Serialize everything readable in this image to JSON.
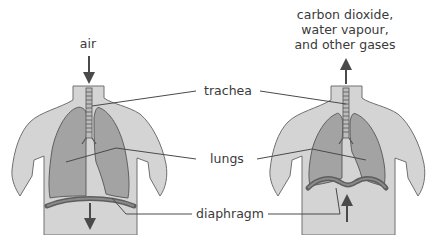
{
  "panels": {
    "left": {
      "state": "inhale",
      "label": "air",
      "arrow_direction_top": "down",
      "arrow_direction_bottom": "down"
    },
    "right": {
      "state": "exhale",
      "label_lines": [
        "carbon dioxide,",
        "water vapour,",
        "and other gases"
      ],
      "arrow_direction_top": "up",
      "arrow_direction_bottom": "up"
    }
  },
  "labels": {
    "trachea": "trachea",
    "lungs": "lungs",
    "diaphragm": "diaphragm"
  },
  "colors": {
    "body": "#d2d2d2",
    "body_outline": "#6f6f6f",
    "lung": "#9a9a9a",
    "lung_outline": "#555555",
    "diaphragm": "#6a6a6a",
    "arrow": "#4a4a4a",
    "leader_line": "#4a4a4a",
    "text": "#3a3a3a"
  }
}
